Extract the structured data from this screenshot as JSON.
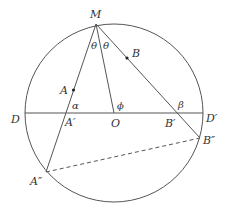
{
  "diagram": {
    "colors": {
      "line": "#555555",
      "dot": "#222222",
      "text": "#333333"
    },
    "circle": {
      "cx": 114,
      "cy": 113,
      "r": 89
    },
    "points": {
      "M": {
        "label": "M",
        "x": 96,
        "y": 24
      },
      "A": {
        "label": "A",
        "x": 73.5,
        "y": 90
      },
      "B": {
        "label": "B",
        "x": 127,
        "y": 58
      },
      "D": {
        "label": "D",
        "x": 25,
        "y": 113
      },
      "D_prime": {
        "label": "D′",
        "x": 203,
        "y": 113
      },
      "O": {
        "label": "O",
        "x": 114,
        "y": 113
      },
      "A_prime": {
        "label": "A′",
        "x": 66,
        "y": 113
      },
      "B_prime": {
        "label": "B′",
        "x": 177,
        "y": 113
      },
      "A_double": {
        "label": "A″",
        "x": 46,
        "y": 172
      },
      "B_double": {
        "label": "B″",
        "x": 200,
        "y": 138
      }
    },
    "angles": {
      "theta_left": "θ",
      "theta_right": "θ",
      "alpha": "α",
      "beta": "β",
      "phi": "ϕ"
    }
  }
}
